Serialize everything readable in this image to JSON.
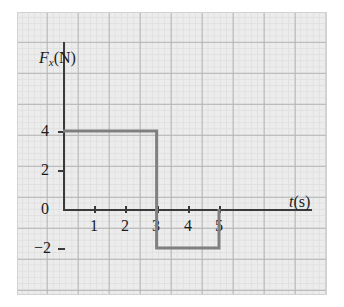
{
  "figure": {
    "background_color": "#ffffff",
    "panel_color": "#ececec",
    "grid_major_color": "#b4b4b4",
    "grid_minor_color": "#e0e0e0",
    "axis_color": "#3a3a3a",
    "curve_color": "#808080"
  },
  "axes": {
    "y_axis_label": "F",
    "y_axis_label_sub": "x",
    "y_axis_label_unit": "(N)",
    "x_axis_label": "t",
    "x_axis_label_unit": "(s)"
  },
  "ticks": {
    "y": [
      {
        "value": 4,
        "label": "4"
      },
      {
        "value": 2,
        "label": "2"
      },
      {
        "value": 0,
        "label": "0"
      },
      {
        "value": -2,
        "label": "−2"
      }
    ],
    "x": [
      {
        "value": 1,
        "label": "1"
      },
      {
        "value": 2,
        "label": "2"
      },
      {
        "value": 3,
        "label": "3"
      },
      {
        "value": 4,
        "label": "4"
      },
      {
        "value": 5,
        "label": "5"
      }
    ]
  },
  "chart_data": {
    "type": "line",
    "title": "",
    "subtitle": "",
    "xlabel": "t(s)",
    "ylabel": "F_x(N)",
    "xlim": [
      0,
      6.6
    ],
    "ylim": [
      -3.3,
      5.3
    ],
    "grid": true,
    "legend": null,
    "series": [
      {
        "name": "Fx(t)",
        "style": "step",
        "color": "#808080",
        "linewidth": 3,
        "x": [
          0,
          3,
          3,
          5,
          5
        ],
        "y": [
          4,
          4,
          -2,
          -2,
          0
        ],
        "description": "Constant +4 N from t=0 s to t=3 s, then constant -2 N from t=3 s to t=5 s, then returns to 0 N."
      }
    ],
    "annotations": []
  }
}
